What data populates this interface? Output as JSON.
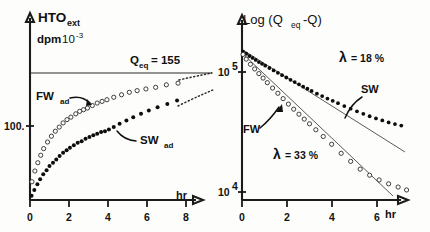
{
  "figure": {
    "title": "",
    "background": "#fdfdfb",
    "panels": [
      "left",
      "right"
    ]
  },
  "colors": {
    "axis": "#1b1b1b",
    "text": "#111111",
    "filled_marker": "#0d0d0d",
    "open_marker_stroke": "#2a2a2a",
    "equilibrium_line": "#6f6f6f",
    "fit_line": "#5a5a5a"
  },
  "left_panel": {
    "y_axis_title_main": "HTO",
    "y_axis_title_sub": "ext",
    "y_axis_units_main": "dpm",
    "y_axis_units_mantissa": "10",
    "y_axis_units_exponent": "-3",
    "y_tick_label": "100.",
    "x_axis_label": "hr",
    "x_ticks": [
      "0",
      "2",
      "4",
      "6",
      "8"
    ],
    "equilibrium_label_main": "Q",
    "equilibrium_label_sub": "eq",
    "equilibrium_label_value": "= 155",
    "equilibrium_value": 155,
    "series_label_fw_main": "FW",
    "series_label_fw_sub": "ad",
    "series_label_sw_main": "SW",
    "series_label_sw_sub": "ad"
  },
  "right_panel": {
    "y_axis_title": "Log (Q",
    "y_axis_title_sub": "eq",
    "y_axis_title_tail": "-Q)",
    "y_ticks": [
      {
        "mantissa": "10",
        "exponent": "5"
      },
      {
        "mantissa": "10",
        "exponent": "4"
      }
    ],
    "x_axis_label": "hr",
    "x_ticks": [
      "0",
      "2",
      "4",
      "6"
    ],
    "lambda_symbol": "λ",
    "lambda_sw_text": "= 18 %",
    "lambda_fw_text": "= 33 %",
    "series_label_sw": "SW",
    "series_label_fw": "FW"
  },
  "chart_data": [
    {
      "type": "scatter",
      "panel": "left",
      "title": "HTOext uptake vs time",
      "xlabel": "hr",
      "ylabel": "HTOext dpm 10-3",
      "xlim": [
        0,
        9.6
      ],
      "ylim": [
        0,
        175
      ],
      "grid": false,
      "legend": "inline-annotations",
      "annotations": [
        {
          "text": "Qeq = 155",
          "type": "horizontal-reference-line",
          "value": 155
        },
        {
          "text": "FWad",
          "type": "series-callout"
        },
        {
          "text": "SWad",
          "type": "series-callout"
        }
      ],
      "series": [
        {
          "name": "FWad",
          "marker": "open-circle",
          "x": [
            0.1,
            0.25,
            0.4,
            0.55,
            0.7,
            0.9,
            1.1,
            1.3,
            1.5,
            1.7,
            1.9,
            2.1,
            2.35,
            2.55,
            2.75,
            2.95,
            3.2,
            3.45,
            3.7,
            3.95,
            4.3,
            4.7,
            5.1,
            5.5,
            5.95,
            6.45,
            7.0,
            7.6
          ],
          "y": [
            22,
            35,
            45,
            54,
            62,
            70,
            77,
            83,
            88,
            93,
            97,
            100,
            104,
            107,
            109,
            111,
            114,
            117,
            119,
            121,
            124,
            127,
            130,
            132,
            134,
            136,
            139,
            141
          ]
        },
        {
          "name": "SWad",
          "marker": "filled-circle",
          "x": [
            0.08,
            0.22,
            0.38,
            0.52,
            0.68,
            0.85,
            1.0,
            1.18,
            1.35,
            1.52,
            1.7,
            1.88,
            2.05,
            2.25,
            2.45,
            2.65,
            2.85,
            3.05,
            3.25,
            3.45,
            3.65,
            3.85,
            4.05,
            4.3,
            4.6,
            4.95,
            5.3,
            5.7,
            6.1,
            6.55,
            7.05,
            7.55
          ],
          "y": [
            5,
            12,
            19,
            25,
            31,
            36,
            41,
            45,
            49,
            53,
            57,
            60,
            63,
            66,
            69,
            71,
            74,
            76,
            78,
            80,
            82,
            83,
            85,
            88,
            92,
            96,
            100,
            104,
            108,
            112,
            116,
            120
          ]
        }
      ],
      "extrapolations": [
        {
          "name": "FWad-dotted",
          "style": "dotted"
        },
        {
          "name": "SWad-dotted",
          "style": "dotted"
        }
      ]
    },
    {
      "type": "scatter",
      "panel": "right",
      "title": "Log (Qeq - Q) vs time",
      "xlabel": "hr",
      "ylabel": "Log (Qeq-Q)",
      "yscale": "log",
      "xlim": [
        0,
        8.2
      ],
      "ylim": [
        10000,
        200000
      ],
      "grid": false,
      "legend": "inline-annotations",
      "annotations": [
        {
          "text": "λ = 18 %",
          "series": "SW"
        },
        {
          "text": "λ = 33 %",
          "series": "FW"
        },
        {
          "text": "SW",
          "type": "series-callout"
        },
        {
          "text": "FW",
          "type": "series-callout"
        }
      ],
      "series": [
        {
          "name": "SW",
          "marker": "filled-circle",
          "decay_rate_percent": 18,
          "x": [
            0.05,
            0.2,
            0.35,
            0.5,
            0.65,
            0.8,
            0.95,
            1.1,
            1.3,
            1.5,
            1.7,
            1.9,
            2.1,
            2.3,
            2.5,
            2.7,
            2.9,
            3.1,
            3.3,
            3.55,
            3.8,
            4.05,
            4.3,
            4.55,
            4.85,
            5.15,
            5.45,
            5.75,
            6.05,
            6.35,
            6.65,
            6.95,
            7.25,
            7.55
          ],
          "y": [
            148000,
            142000,
            136000,
            131000,
            126000,
            121000,
            117000,
            113000,
            108000,
            103000,
            98500,
            94000,
            90000,
            86000,
            82500,
            79000,
            75500,
            72500,
            69500,
            66000,
            63000,
            60000,
            57500,
            55000,
            52000,
            49500,
            47000,
            44800,
            42800,
            41000,
            39500,
            38000,
            36800,
            35800
          ]
        },
        {
          "name": "FW",
          "marker": "open-circle",
          "decay_rate_percent": 33,
          "x": [
            0.05,
            0.2,
            0.4,
            0.6,
            0.8,
            1.0,
            1.2,
            1.45,
            1.7,
            1.95,
            2.2,
            2.45,
            2.7,
            2.95,
            3.2,
            3.5,
            3.85,
            4.25,
            4.7,
            5.15,
            5.6,
            6.05,
            6.5,
            6.95,
            7.4,
            7.8
          ],
          "y": [
            140000,
            128000,
            116000,
            106000,
            97000,
            89000,
            81500,
            73500,
            66500,
            60000,
            54000,
            49000,
            44500,
            40500,
            37000,
            33000,
            29000,
            25000,
            21000,
            18000,
            15500,
            13800,
            12600,
            11700,
            11000,
            10400
          ]
        }
      ]
    }
  ]
}
